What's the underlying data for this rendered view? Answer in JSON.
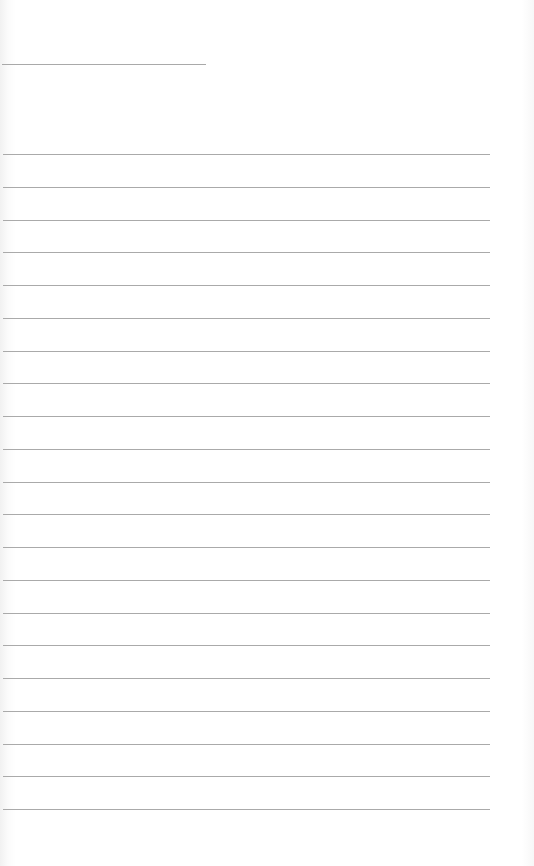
{
  "page": {
    "type": "lined-paper",
    "title_line": {
      "y": 64,
      "x_start": 2,
      "x_end": 206
    },
    "ruled_lines": {
      "count": 21,
      "first_y": 154,
      "spacing": 32.75,
      "x_start": 3,
      "x_end": 490
    },
    "colors": {
      "paper": "#ffffff",
      "line": "#aaaaaa"
    }
  }
}
